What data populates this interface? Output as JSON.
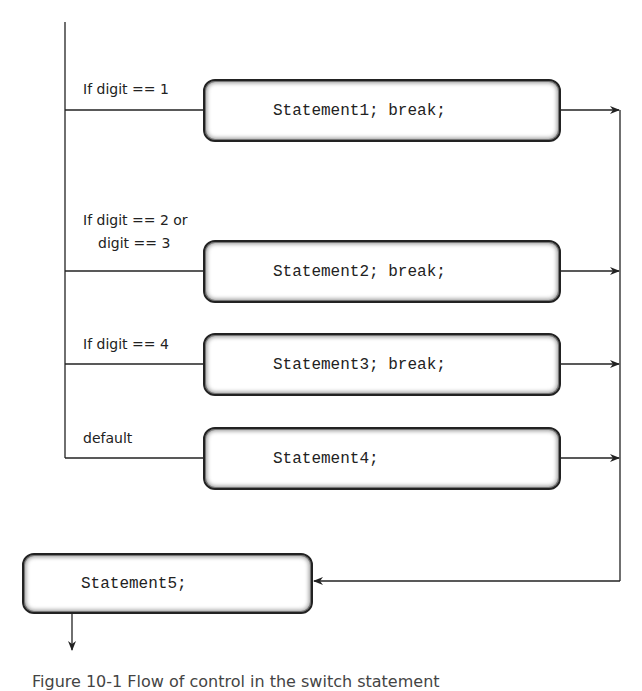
{
  "diagram": {
    "type": "flowchart",
    "branches": [
      {
        "condition": "If digit == 1",
        "statement": "Statement1; break;"
      },
      {
        "condition_line1": "If digit == 2 or",
        "condition_line2": "digit == 3",
        "statement": "Statement2; break;"
      },
      {
        "condition": "If digit == 4",
        "statement": "Statement3; break;"
      },
      {
        "condition": "default",
        "statement": "Statement4;"
      }
    ],
    "merge": {
      "statement": "Statement5;"
    },
    "caption": "Figure 10-1   Flow of control in the switch statement"
  },
  "colors": {
    "line": "#222222",
    "background": "#ffffff"
  }
}
